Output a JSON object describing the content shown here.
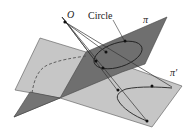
{
  "diagram": {
    "type": "geometry-projection",
    "labels": {
      "origin": "O",
      "circle": "Circle",
      "plane_pi": "π",
      "plane_pi_prime": "π′"
    },
    "colors": {
      "plane_pi_fill": "#6f6f6f",
      "plane_pi_prime_fill": "#c4c4c4",
      "edge": "#4a4a4a",
      "curve": "#2a2a2a",
      "background": "#ffffff"
    }
  }
}
